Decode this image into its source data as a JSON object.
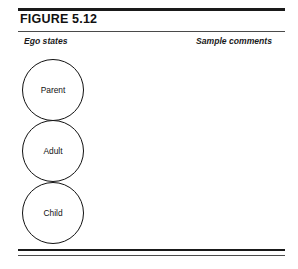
{
  "figure": {
    "title": "FIGURE 5.12",
    "columns": {
      "left_caption": "Ego states",
      "right_caption": "Sample comments"
    },
    "ego_states": [
      {
        "label": "Parent"
      },
      {
        "label": "Adult"
      },
      {
        "label": "Child"
      }
    ],
    "sample_comments": [],
    "colors": {
      "rule": "#1a1a1a",
      "rule_light": "#4a4a4a",
      "circle_stroke": "#111111",
      "background": "#ffffff",
      "text": "#111111"
    }
  }
}
